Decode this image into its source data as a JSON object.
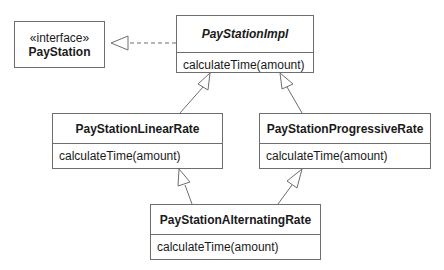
{
  "diagram": {
    "type": "UML class diagram",
    "classes": [
      {
        "id": "paystation",
        "stereotype": "«interface»",
        "name": "PayStation",
        "operations": []
      },
      {
        "id": "paystationimpl",
        "name": "PayStationImpl",
        "abstract": true,
        "operations": [
          "calculateTime(amount)"
        ]
      },
      {
        "id": "linear",
        "name": "PayStationLinearRate",
        "operations": [
          "calculateTime(amount)"
        ]
      },
      {
        "id": "progressive",
        "name": "PayStationProgressiveRate",
        "operations": [
          "calculateTime(amount)"
        ]
      },
      {
        "id": "alternating",
        "name": "PayStationAlternatingRate",
        "operations": [
          "calculateTime(amount)"
        ]
      }
    ],
    "relations": [
      {
        "from": "PayStationImpl",
        "to": "PayStation",
        "kind": "realization",
        "line": "dashed"
      },
      {
        "from": "PayStationLinearRate",
        "to": "PayStationImpl",
        "kind": "generalization",
        "line": "solid"
      },
      {
        "from": "PayStationProgressiveRate",
        "to": "PayStationImpl",
        "kind": "generalization",
        "line": "solid"
      },
      {
        "from": "PayStationAlternatingRate",
        "to": "PayStationLinearRate",
        "kind": "generalization",
        "line": "solid"
      },
      {
        "from": "PayStationAlternatingRate",
        "to": "PayStationProgressiveRate",
        "kind": "generalization",
        "line": "solid"
      }
    ],
    "colors": {
      "stroke": "#6e6e6e",
      "text": "#1a1a1a",
      "background": "#ffffff"
    }
  }
}
